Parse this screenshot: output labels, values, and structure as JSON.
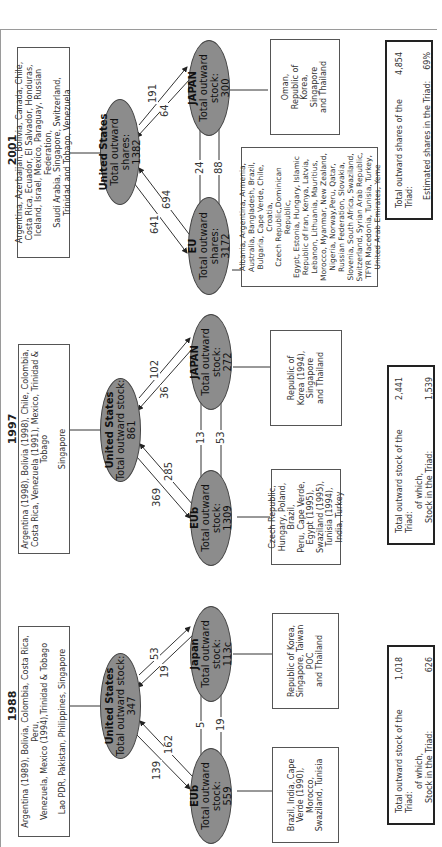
{
  "figure": {
    "orientation": "rotated-90-ccw",
    "panels": [
      {
        "year": "1988",
        "us": {
          "name": "United States",
          "label": "Total outward stock:",
          "value": "347"
        },
        "japan": {
          "name": "Japan",
          "label": "Total outward stock:",
          "value": "113c"
        },
        "eu": {
          "name": "EUb",
          "label": "Total outward stock:",
          "value": "559"
        },
        "flows": {
          "us_to_eu": "139",
          "eu_to_us": "162",
          "us_to_japan": "19",
          "japan_to_us": "53",
          "eu_to_japan": "5",
          "japan_to_eu": "19"
        },
        "us_countries": [
          "Argentina (1989), Bolivia, Colombia, Costa Rica, Peru,",
          "Venezuela, Mexico (1994),Trinidad & Tobago"
        ],
        "us_countries_2": "Lao PDR, Pakistan, Philippines, Singapore",
        "japan_countries": [
          "Republic of Korea,",
          "Singapore, Taiwan POC",
          "and Thailand"
        ],
        "eu_countries": [
          "Brazil, India, Cape",
          "Verde (1990), Morocco,",
          "Swaziland, Tunisia"
        ],
        "summary": {
          "row1_label": "Total outward stock of the Triad:",
          "row1_value": "1,018",
          "row2_label": "of which,",
          "row3_label": "Stock in the Triad:",
          "row3_value": "626"
        }
      },
      {
        "year": "1997",
        "us": {
          "name": "United States",
          "label": "Total outward stock:",
          "value": "861"
        },
        "japan": {
          "name": "JAPAN",
          "label": "Total outward stock:",
          "value": "272"
        },
        "eu": {
          "name": "EUb",
          "label": "Total outward stock:",
          "value": "1309"
        },
        "flows": {
          "us_to_eu": "369",
          "eu_to_us": "285",
          "us_to_japan": "36",
          "japan_to_us": "102",
          "eu_to_japan": "13",
          "japan_to_eu": "53"
        },
        "us_countries": [
          "Argentina (1998), Bolivia (1998), Chile, Colombia,",
          "Costa Rica, Venezuela (1991), Mexico, Trinidad &",
          "Tobago"
        ],
        "us_countries_2": "Singapore",
        "japan_countries": [
          "Republic of",
          "Korea (1994),",
          "Singapore",
          "and Thailand"
        ],
        "eu_countries": [
          "Czech Republic,",
          "Hungary, Poland, Brazil,",
          "Peru, Cape Verde,",
          "Egypt (1995),",
          "Swaziland (1995),",
          "Tunisia (1994),",
          "India, Turkey"
        ],
        "summary": {
          "row1_label": "Total outward stock of the Triad:",
          "row1_value": "2,441",
          "row2_label": "of which,",
          "row3_label": "Stock in the Triad:",
          "row3_value": "1,539"
        }
      },
      {
        "year": "2001",
        "us": {
          "name": "United States",
          "label": "Total outward shares:",
          "value": "1382"
        },
        "japan": {
          "name": "JAPAN",
          "label": "Total outward stock:",
          "value": "300"
        },
        "eu": {
          "name": "EU",
          "label": "Total outward shares:",
          "value": "3172"
        },
        "flows": {
          "us_to_eu": "641",
          "eu_to_us": "694",
          "us_to_japan": "64",
          "japan_to_us": "191",
          "eu_to_japan": "24",
          "japan_to_eu": "88"
        },
        "us_countries": [
          "Argentina, Azerbaijan, Bolivia, Canada, Chile,",
          "Costa Rica, Ecuador, El Salvador, Honduras,",
          "Iceland, Israel, Mexico, Paraguay, Russian Federation,",
          "Saudi Arabia, Singapore, Switzerland,",
          "Trinidad and Tobago, Venezuela"
        ],
        "us_countries_2": "",
        "japan_countries": [
          "Oman,",
          "Republic of",
          "Korea,",
          "Singapore",
          "and Thailand"
        ],
        "eu_countries": [
          "Albania, Argentina, Armenia,",
          "Australia, Bangladesh, Brazil,",
          "Bulgaria, Cape Verde, Chile, Croatia,",
          "Czech Republic,Dominican Republic,",
          "Egypt, Estonia, Hungary, Islamic",
          "Republic of Iran, Kenya, Latvia,",
          "Lebanon, Lithuania, Mauritius,",
          "Morocco, Myanmar, New Zealand,",
          "Nigeria, Norway,Peru, Qatar,",
          "Russian Federation, Slovakia,",
          "Slovenia, South Africa, Swaziland,",
          "Switzerland, Syrian Arab Republic,",
          "TFYR Macedonia, Tunisia, Turkey,",
          "United Arab Emirates, Yeme"
        ],
        "summary": {
          "row1_label": "Total outward shares of the Triad:",
          "row1_value": "4,854",
          "row2_label": "",
          "row3_label": "Estimated shares in the Triad:",
          "row3_value": "69%"
        }
      }
    ]
  },
  "colors": {
    "ellipse_fill": "#8c8c8c",
    "ellipse_border": "#444444",
    "box_border": "#555555",
    "summary_border": "#222222",
    "frame": "#9a9a9a"
  }
}
